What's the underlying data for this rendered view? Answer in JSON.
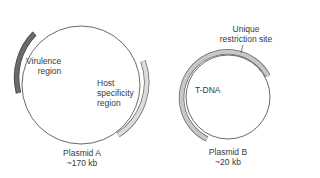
{
  "plasmid_a": {
    "name": "Plasmid A",
    "size": "~170 kb",
    "regions": [
      {
        "label_line1": "Virulence",
        "label_line2": "region",
        "color": "#555555"
      },
      {
        "label_line1": "Host",
        "label_line2": "specificity",
        "label_line3": "region",
        "color": "#d4d4d4"
      }
    ]
  },
  "plasmid_b": {
    "name": "Plasmid B",
    "size": "~20 kb",
    "regions": [
      {
        "label_line1": "T-DNA",
        "color": "#c8c8c8"
      }
    ],
    "site": {
      "label_line1": "Unique",
      "label_line2": "restriction site"
    }
  },
  "colors": {
    "backbone": "#444444",
    "text": "#3a3a3a"
  }
}
